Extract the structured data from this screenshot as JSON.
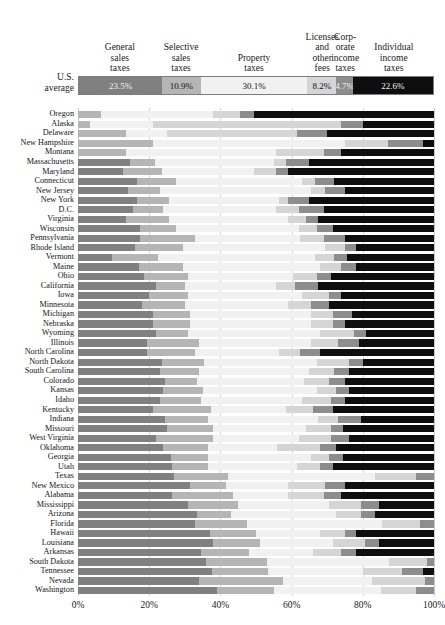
{
  "legend": {
    "row_label": "U.S.\naverage",
    "row_label_lines": [
      "U.S.",
      "average"
    ],
    "columns": [
      {
        "key": "general_sales",
        "lines": [
          "General",
          "sales",
          "taxes"
        ],
        "value": "23.5%",
        "color": "#808080",
        "text_color": "#efefef"
      },
      {
        "key": "selective_sales",
        "lines": [
          "Selective",
          "sales",
          "taxes"
        ],
        "value": "10.9%",
        "color": "#b5b5b5",
        "text_color": "#111111"
      },
      {
        "key": "property",
        "lines": [
          "Property",
          "taxes"
        ],
        "value": "30.1%",
        "color": "#f1f1f1",
        "text_color": "#111111"
      },
      {
        "key": "licenses_fees",
        "lines": [
          "Licenses",
          "and",
          "other",
          "fees"
        ],
        "value": "8.2%",
        "color": "#d5d5d5",
        "text_color": "#111111"
      },
      {
        "key": "corporate_income",
        "lines": [
          "Corp-",
          "orate",
          "income",
          "taxes"
        ],
        "value": "4.7%",
        "color": "#8d8d8d",
        "text_color": "#efefef"
      },
      {
        "key": "individual_income",
        "lines": [
          "Individual",
          "income",
          "taxes"
        ],
        "value": "22.6%",
        "color": "#0e0e0e",
        "text_color": "#f2f2f2"
      }
    ]
  },
  "axis": {
    "ticks": [
      "0%",
      "20%",
      "40%",
      "60%",
      "80%",
      "100%"
    ],
    "tick_values": [
      0,
      20,
      40,
      60,
      80,
      100
    ]
  },
  "chart_data": {
    "type": "bar",
    "orientation": "horizontal",
    "stacked": true,
    "normalized_percent": true,
    "title": "",
    "xlabel": "",
    "ylabel": "",
    "xlim": [
      0,
      100
    ],
    "grid": true,
    "legend_position": "top",
    "series": [
      {
        "name": "General sales taxes",
        "color": "#808080"
      },
      {
        "name": "Selective sales taxes",
        "color": "#b5b5b5"
      },
      {
        "name": "Property taxes",
        "color": "#f1f1f1"
      },
      {
        "name": "Licenses and other fees",
        "color": "#d5d5d5"
      },
      {
        "name": "Corporate income taxes",
        "color": "#8d8d8d"
      },
      {
        "name": "Individual income taxes",
        "color": "#0e0e0e"
      }
    ],
    "us_average": [
      23.5,
      10.9,
      30.1,
      8.2,
      4.7,
      22.6
    ],
    "categories": [
      "Oregon",
      "Alaska",
      "Delaware",
      "New Hampshire",
      "Montana",
      "Massachusetts",
      "Maryland",
      "Connecticut",
      "New Jersey",
      "New York",
      "D.C.",
      "Virginia",
      "Wisconsin",
      "Pennsylvania",
      "Rhode Island",
      "Vermont",
      "Maine",
      "Ohio",
      "California",
      "Iowa",
      "Minnesota",
      "Michigan",
      "Nebraska",
      "Wyoming",
      "Illinois",
      "North Carolina",
      "North Dakota",
      "South Carolina",
      "Colorado",
      "Kansas",
      "Idaho",
      "Kentucky",
      "Indiana",
      "Missouri",
      "West Virginia",
      "Oklahoma",
      "Georgia",
      "Utah",
      "Texas",
      "New Mexico",
      "Alabama",
      "Mississippi",
      "Arizona",
      "Florida",
      "Hawaii",
      "Louisiana",
      "Arkansas",
      "South Dakota",
      "Tennessee",
      "Nevada",
      "Washington"
    ],
    "rows": [
      {
        "state": "Oregon",
        "values": [
          0.0,
          6.5,
          31.5,
          7.5,
          4.0,
          50.5
        ]
      },
      {
        "state": "Alaska",
        "values": [
          0.0,
          3.5,
          17.5,
          53.0,
          6.0,
          20.0
        ]
      },
      {
        "state": "Delaware",
        "values": [
          0.0,
          13.5,
          11.5,
          36.5,
          8.5,
          30.0
        ]
      },
      {
        "state": "New Hampshire",
        "values": [
          0.0,
          21.0,
          54.0,
          12.0,
          10.0,
          3.0
        ]
      },
      {
        "state": "Montana",
        "values": [
          0.0,
          13.5,
          42.0,
          13.5,
          5.0,
          26.0
        ]
      },
      {
        "state": "Massachusetts",
        "values": [
          14.5,
          7.0,
          33.5,
          3.5,
          6.5,
          35.0
        ]
      },
      {
        "state": "Maryland",
        "values": [
          12.5,
          11.0,
          26.0,
          6.0,
          3.5,
          41.0
        ]
      },
      {
        "state": "Connecticut",
        "values": [
          16.5,
          11.0,
          35.5,
          3.5,
          5.5,
          28.0
        ]
      },
      {
        "state": "New Jersey",
        "values": [
          14.0,
          9.0,
          42.5,
          4.0,
          5.5,
          25.0
        ]
      },
      {
        "state": "New York",
        "values": [
          16.5,
          9.0,
          31.0,
          2.5,
          6.0,
          35.0
        ]
      },
      {
        "state": "D.C.",
        "values": [
          15.5,
          8.5,
          31.5,
          6.5,
          7.0,
          31.0
        ]
      },
      {
        "state": "Virginia",
        "values": [
          13.5,
          12.0,
          33.5,
          5.0,
          3.5,
          32.5
        ]
      },
      {
        "state": "Wisconsin",
        "values": [
          17.5,
          10.0,
          34.5,
          5.0,
          4.5,
          28.5
        ]
      },
      {
        "state": "Pennsylvania",
        "values": [
          17.5,
          15.5,
          29.5,
          6.5,
          6.0,
          25.0
        ]
      },
      {
        "state": "Rhode Island",
        "values": [
          16.0,
          13.5,
          40.0,
          5.5,
          3.0,
          22.0
        ]
      },
      {
        "state": "Vermont",
        "values": [
          9.5,
          13.0,
          44.0,
          5.5,
          3.5,
          24.5
        ]
      },
      {
        "state": "Maine",
        "values": [
          17.0,
          12.5,
          38.5,
          6.0,
          4.0,
          22.0
        ]
      },
      {
        "state": "Ohio",
        "values": [
          18.5,
          12.5,
          29.5,
          6.5,
          4.0,
          29.0
        ]
      },
      {
        "state": "California",
        "values": [
          22.0,
          8.0,
          25.5,
          5.5,
          6.5,
          32.5
        ]
      },
      {
        "state": "Iowa",
        "values": [
          20.0,
          11.0,
          32.0,
          7.5,
          3.5,
          26.0
        ]
      },
      {
        "state": "Minnesota",
        "values": [
          18.0,
          12.0,
          29.0,
          6.5,
          5.0,
          29.5
        ]
      },
      {
        "state": "Michigan",
        "values": [
          21.0,
          10.5,
          34.0,
          6.0,
          5.5,
          23.0
        ]
      },
      {
        "state": "Nebraska",
        "values": [
          21.0,
          10.5,
          34.0,
          6.0,
          3.5,
          25.0
        ]
      },
      {
        "state": "Wyoming",
        "values": [
          22.0,
          9.0,
          37.0,
          9.5,
          3.5,
          19.0
        ]
      },
      {
        "state": "Illinois",
        "values": [
          19.5,
          14.5,
          31.5,
          7.5,
          6.0,
          21.0
        ]
      },
      {
        "state": "North Carolina",
        "values": [
          19.5,
          13.5,
          23.5,
          6.0,
          5.5,
          32.0
        ]
      },
      {
        "state": "North Dakota",
        "values": [
          23.5,
          12.0,
          31.5,
          9.0,
          4.0,
          20.0
        ]
      },
      {
        "state": "South Carolina",
        "values": [
          23.0,
          11.0,
          31.0,
          7.0,
          4.0,
          24.0
        ]
      },
      {
        "state": "Colorado",
        "values": [
          24.5,
          9.0,
          30.0,
          7.0,
          4.5,
          25.0
        ]
      },
      {
        "state": "Kansas",
        "values": [
          24.0,
          11.0,
          32.0,
          5.5,
          3.5,
          24.0
        ]
      },
      {
        "state": "Idaho",
        "values": [
          23.0,
          11.5,
          28.5,
          8.0,
          4.0,
          25.0
        ]
      },
      {
        "state": "Kentucky",
        "values": [
          21.0,
          16.5,
          21.0,
          7.5,
          5.5,
          28.5
        ]
      },
      {
        "state": "Indiana",
        "values": [
          24.5,
          12.0,
          31.0,
          5.5,
          6.5,
          20.5
        ]
      },
      {
        "state": "Missouri",
        "values": [
          25.0,
          13.0,
          26.0,
          7.0,
          3.5,
          25.5
        ]
      },
      {
        "state": "West Virginia",
        "values": [
          22.0,
          16.0,
          24.0,
          9.0,
          5.0,
          24.0
        ]
      },
      {
        "state": "Oklahoma",
        "values": [
          24.0,
          12.5,
          19.5,
          12.0,
          4.5,
          27.5
        ]
      },
      {
        "state": "Georgia",
        "values": [
          26.0,
          10.5,
          29.0,
          5.0,
          4.0,
          25.5
        ]
      },
      {
        "state": "Utah",
        "values": [
          26.5,
          10.0,
          25.0,
          6.5,
          3.5,
          28.5
        ]
      },
      {
        "state": "Texas",
        "values": [
          27.0,
          15.0,
          41.5,
          11.5,
          5.0,
          0.0
        ]
      },
      {
        "state": "New Mexico",
        "values": [
          31.5,
          10.0,
          17.5,
          10.5,
          5.5,
          25.0
        ]
      },
      {
        "state": "Alabama",
        "values": [
          26.5,
          17.0,
          15.5,
          10.0,
          5.0,
          26.0
        ]
      },
      {
        "state": "Mississippi",
        "values": [
          31.0,
          14.0,
          25.5,
          9.0,
          5.0,
          15.5
        ]
      },
      {
        "state": "Arizona",
        "values": [
          33.5,
          9.5,
          29.5,
          7.0,
          4.0,
          16.5
        ]
      },
      {
        "state": "Florida",
        "values": [
          33.0,
          14.5,
          38.0,
          10.5,
          4.0,
          0.0
        ]
      },
      {
        "state": "Hawaii",
        "values": [
          37.0,
          13.0,
          18.0,
          7.0,
          3.0,
          22.0
        ]
      },
      {
        "state": "Louisiana",
        "values": [
          38.0,
          13.0,
          20.5,
          9.0,
          4.0,
          15.5
        ]
      },
      {
        "state": "Arkansas",
        "values": [
          34.5,
          13.5,
          18.0,
          8.0,
          4.0,
          22.0
        ]
      },
      {
        "state": "South Dakota",
        "values": [
          36.0,
          17.0,
          34.5,
          10.5,
          2.0,
          0.0
        ]
      },
      {
        "state": "Tennessee",
        "values": [
          37.5,
          16.0,
          26.5,
          11.0,
          6.0,
          3.0
        ]
      },
      {
        "state": "Nevada",
        "values": [
          34.0,
          23.5,
          25.0,
          15.0,
          2.5,
          0.0
        ]
      },
      {
        "state": "Washington",
        "values": [
          39.0,
          16.0,
          30.0,
          10.0,
          5.0,
          0.0
        ]
      }
    ]
  }
}
